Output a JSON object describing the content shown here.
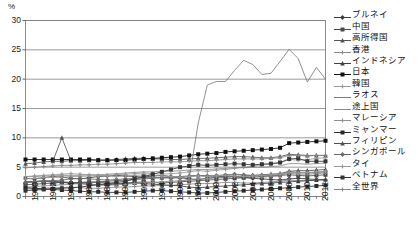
{
  "chart_data": {
    "type": "line",
    "title": "",
    "xlabel": "",
    "ylabel": "%",
    "ylim": [
      0,
      30
    ],
    "yticks": [
      0,
      5,
      10,
      15,
      20,
      25,
      30
    ],
    "xlim": [
      1980,
      2013
    ],
    "grid": true,
    "legend_position": "right",
    "tick_labels": {
      "y": [
        "0",
        "5",
        "10",
        "15",
        "20",
        "25",
        "30"
      ],
      "x": [
        "1980",
        "1982",
        "1984",
        "1986",
        "1988",
        "1990",
        "1992",
        "1994",
        "1996",
        "1998",
        "2000",
        "2002",
        "2004",
        "2006",
        "2008",
        "2010",
        "2012"
      ]
    },
    "x": [
      1980,
      1981,
      1982,
      1983,
      1984,
      1985,
      1986,
      1987,
      1988,
      1989,
      1990,
      1991,
      1992,
      1993,
      1994,
      1995,
      1996,
      1997,
      1998,
      1999,
      2000,
      2001,
      2002,
      2003,
      2004,
      2005,
      2006,
      2007,
      2008,
      2009,
      2010,
      2011,
      2012,
      2013
    ],
    "series": [
      {
        "name": "ブルネイ",
        "marker": "diamond",
        "color": "#3b3b3b",
        "values": [
          3.1,
          3.0,
          3.2,
          3.4,
          3.3,
          3.1,
          3.0,
          3.2,
          3.4,
          3.5,
          3.6,
          3.5,
          3.4,
          3.3,
          3.5,
          3.6,
          3.4,
          3.2,
          3.0,
          2.9,
          3.1,
          3.3,
          3.5,
          3.4,
          3.2,
          3.1,
          3.0,
          2.9,
          2.8,
          3.0,
          3.1,
          3.0,
          2.9,
          2.8
        ]
      },
      {
        "name": "中国",
        "marker": "square",
        "color": "#4a4a4a",
        "values": [
          2.0,
          2.1,
          2.2,
          2.3,
          2.4,
          2.3,
          2.4,
          2.5,
          2.4,
          2.3,
          2.2,
          2.3,
          2.4,
          2.5,
          2.4,
          2.3,
          2.4,
          2.5,
          2.6,
          2.7,
          2.8,
          2.9,
          3.0,
          3.1,
          3.2,
          3.3,
          3.4,
          3.5,
          3.6,
          3.7,
          3.6,
          3.5,
          3.6,
          3.7
        ]
      },
      {
        "name": "高所得国",
        "marker": "triangle",
        "color": "#555555",
        "values": [
          5.6,
          5.7,
          5.9,
          6.0,
          6.0,
          6.1,
          6.1,
          6.2,
          6.2,
          6.2,
          6.3,
          6.4,
          6.5,
          6.5,
          6.4,
          6.4,
          6.3,
          6.3,
          6.4,
          6.5,
          6.5,
          6.6,
          6.7,
          6.8,
          6.8,
          6.7,
          6.6,
          6.6,
          6.8,
          7.2,
          7.1,
          7.0,
          7.0,
          7.0
        ]
      },
      {
        "name": "香港",
        "marker": "cross",
        "color": "#8a8a8a",
        "values": [
          1.3,
          1.3,
          1.4,
          1.5,
          1.5,
          1.6,
          1.5,
          1.4,
          1.4,
          1.5,
          1.6,
          1.6,
          1.7,
          1.8,
          1.8,
          1.9,
          1.9,
          2.0,
          2.1,
          2.2,
          2.2,
          2.3,
          2.4,
          2.4,
          2.3,
          2.3,
          2.4,
          2.5,
          2.6,
          2.8,
          2.7,
          2.7,
          2.8,
          2.9
        ]
      },
      {
        "name": "インドネシア",
        "marker": "triangle",
        "color": "#3f3f3f",
        "values": [
          2.4,
          2.5,
          2.6,
          2.5,
          2.4,
          2.3,
          2.2,
          2.1,
          2.0,
          2.0,
          2.1,
          2.2,
          2.3,
          2.2,
          2.1,
          2.0,
          1.9,
          1.8,
          1.6,
          1.5,
          1.6,
          1.7,
          1.8,
          1.9,
          2.0,
          2.1,
          2.2,
          2.3,
          2.4,
          2.5,
          2.6,
          2.7,
          2.8,
          2.9
        ]
      },
      {
        "name": "日本",
        "marker": "square",
        "color": "#111111",
        "values": [
          6.3,
          6.3,
          6.3,
          6.3,
          6.3,
          6.3,
          6.3,
          6.3,
          6.2,
          6.2,
          6.2,
          6.2,
          6.3,
          6.4,
          6.5,
          6.6,
          6.7,
          6.8,
          7.0,
          7.2,
          7.3,
          7.4,
          7.6,
          7.7,
          7.8,
          7.9,
          8.0,
          8.1,
          8.3,
          9.1,
          9.2,
          9.3,
          9.4,
          9.5
        ]
      },
      {
        "name": "韓国",
        "marker": "cross",
        "color": "#9a9a9a",
        "values": [
          3.0,
          3.1,
          3.2,
          3.3,
          3.3,
          3.4,
          3.4,
          3.5,
          3.5,
          3.6,
          3.7,
          3.8,
          3.9,
          4.0,
          3.9,
          3.8,
          3.9,
          4.0,
          4.2,
          4.4,
          4.3,
          4.5,
          4.6,
          4.8,
          5.0,
          5.2,
          5.4,
          5.5,
          5.7,
          6.3,
          6.2,
          6.3,
          6.5,
          6.6
        ]
      },
      {
        "name": "ラオス",
        "marker": "none",
        "color": "#6d6d6d",
        "values": [
          null,
          null,
          null,
          null,
          null,
          null,
          null,
          null,
          null,
          null,
          null,
          null,
          null,
          null,
          null,
          null,
          null,
          2.5,
          3.0,
          12.5,
          19.0,
          19.6,
          19.6,
          21.5,
          23.2,
          22.5,
          20.8,
          21.0,
          23.0,
          25.1,
          23.5,
          19.5,
          22.0,
          20.0
        ]
      },
      {
        "name": "途上国",
        "marker": "none",
        "color": "#7c7c7c",
        "values": [
          3.4,
          3.4,
          3.5,
          3.5,
          3.6,
          3.6,
          3.6,
          3.7,
          3.7,
          3.8,
          3.9,
          4.0,
          4.1,
          4.2,
          4.2,
          4.3,
          4.3,
          4.4,
          4.5,
          4.6,
          4.6,
          4.7,
          4.8,
          4.9,
          4.9,
          5.0,
          5.0,
          5.1,
          5.2,
          5.6,
          5.6,
          5.5,
          5.6,
          5.7
        ]
      },
      {
        "name": "マレーシア",
        "marker": "cross",
        "color": "#8f8f8f",
        "values": [
          1.6,
          1.7,
          1.8,
          1.9,
          2.0,
          2.1,
          2.2,
          2.1,
          2.0,
          1.9,
          2.0,
          2.1,
          2.2,
          2.3,
          2.4,
          2.5,
          2.6,
          2.7,
          2.8,
          3.0,
          3.0,
          3.2,
          3.3,
          3.4,
          3.5,
          3.4,
          3.3,
          3.4,
          3.5,
          4.0,
          3.8,
          3.8,
          3.9,
          4.0
        ]
      },
      {
        "name": "ミャンマー",
        "marker": "square",
        "color": "#2a2a2a",
        "values": [
          1.5,
          1.4,
          1.3,
          1.2,
          1.1,
          1.0,
          0.9,
          0.8,
          0.8,
          0.7,
          0.7,
          0.7,
          0.8,
          0.9,
          1.0,
          1.0,
          0.9,
          0.8,
          0.7,
          0.6,
          0.6,
          0.7,
          0.8,
          0.9,
          1.0,
          1.1,
          1.2,
          1.3,
          1.4,
          1.5,
          1.6,
          1.7,
          1.8,
          1.9
        ]
      },
      {
        "name": "フィリピン",
        "marker": "triangle",
        "color": "#4f4f4f",
        "values": [
          2.5,
          2.6,
          2.7,
          2.6,
          2.5,
          2.4,
          2.3,
          2.4,
          2.5,
          2.6,
          2.7,
          2.8,
          2.9,
          3.0,
          3.1,
          3.2,
          3.3,
          3.4,
          3.5,
          3.6,
          3.5,
          3.4,
          3.3,
          3.4,
          3.5,
          3.6,
          3.7,
          3.8,
          3.9,
          4.3,
          4.4,
          4.4,
          4.5,
          4.6
        ]
      },
      {
        "name": "シンガポール",
        "marker": "diamond",
        "color": "#6a6a6a",
        "values": [
          2.4,
          2.5,
          2.6,
          2.7,
          2.8,
          3.0,
          3.1,
          3.0,
          2.9,
          2.8,
          2.9,
          3.0,
          3.1,
          3.2,
          3.3,
          3.2,
          3.1,
          3.2,
          3.4,
          3.6,
          3.5,
          3.6,
          3.7,
          3.8,
          3.7,
          3.6,
          3.5,
          3.6,
          3.7,
          4.2,
          4.1,
          4.0,
          4.1,
          4.2
        ]
      },
      {
        "name": "タイ",
        "marker": "cross",
        "color": "#969696",
        "values": [
          3.4,
          3.5,
          3.6,
          3.7,
          3.8,
          3.9,
          3.8,
          3.7,
          3.6,
          3.5,
          3.4,
          3.5,
          3.6,
          3.7,
          3.6,
          3.5,
          3.4,
          3.3,
          3.4,
          3.5,
          3.4,
          3.5,
          3.6,
          3.5,
          3.4,
          3.5,
          3.6,
          3.7,
          3.8,
          4.1,
          4.0,
          4.1,
          4.2,
          4.3
        ]
      },
      {
        "name": "ベトナム",
        "marker": "square",
        "color": "#353535",
        "values": [
          1.0,
          1.1,
          1.2,
          1.3,
          1.4,
          1.5,
          1.6,
          1.8,
          2.0,
          2.2,
          2.4,
          2.6,
          3.0,
          3.4,
          3.8,
          4.2,
          4.6,
          5.0,
          5.2,
          5.4,
          5.3,
          5.4,
          5.5,
          5.6,
          5.5,
          5.4,
          5.5,
          5.6,
          5.8,
          6.4,
          6.5,
          6.0,
          6.0,
          6.0
        ]
      },
      {
        "name": "全世界",
        "marker": "cross",
        "color": "#888888",
        "values": [
          4.9,
          5.0,
          5.1,
          5.2,
          5.3,
          5.3,
          5.4,
          5.4,
          5.5,
          5.5,
          5.6,
          5.7,
          5.8,
          5.8,
          5.8,
          5.9,
          5.9,
          5.9,
          6.0,
          6.1,
          6.1,
          6.2,
          6.3,
          6.4,
          6.4,
          6.4,
          6.4,
          6.5,
          6.6,
          7.0,
          7.0,
          6.9,
          7.0,
          7.0
        ]
      }
    ],
    "spike_note": {
      "series": "高所得国",
      "year": 1984,
      "value": 10.0
    }
  }
}
